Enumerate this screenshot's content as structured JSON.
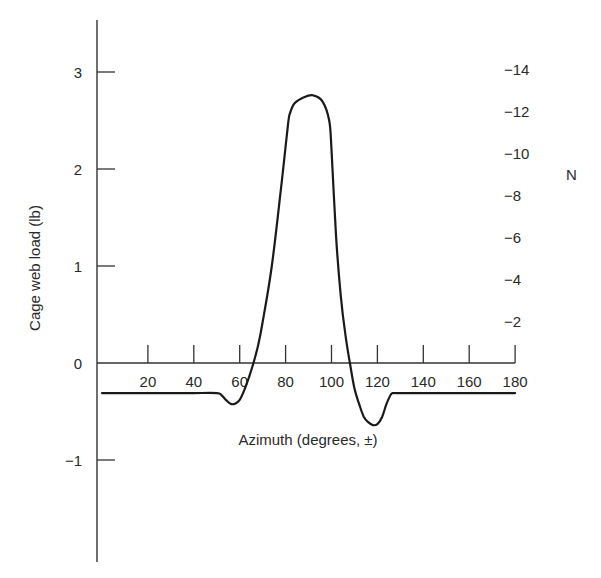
{
  "chart_data": {
    "type": "line",
    "title": "",
    "xlabel": "Azimuth (degrees, ±)",
    "ylabel": "Cage web load (lb)",
    "y2label": "N",
    "xlim": [
      0,
      180
    ],
    "ylim": [
      -2.0,
      3.5
    ],
    "y2lim": [
      0,
      -14
    ],
    "x_ticks": [
      20,
      40,
      60,
      80,
      100,
      120,
      140,
      160,
      180
    ],
    "x_tick_labels": [
      "20",
      "40",
      "60",
      "80",
      "100",
      "120",
      "140",
      "160",
      "180"
    ],
    "y_ticks": [
      3,
      2,
      1,
      0,
      -1
    ],
    "y_tick_labels": [
      "3",
      "2",
      "1",
      "0",
      "−1"
    ],
    "y2_ticks": [
      -14,
      -12,
      -10,
      -8,
      -6,
      -4,
      -2
    ],
    "y2_tick_labels": [
      "−14",
      "−12",
      "−10",
      "−8",
      "−6",
      "−4",
      "−2"
    ],
    "grid": false,
    "legend": null,
    "series": [
      {
        "name": "Cage web load",
        "x": [
          0,
          10,
          20,
          30,
          40,
          50,
          52,
          54,
          56,
          58,
          60,
          62,
          64,
          66,
          68,
          70,
          74,
          78,
          81,
          82,
          84,
          88,
          92,
          96,
          99,
          100,
          102,
          104,
          106,
          108,
          110,
          112,
          114,
          116,
          118,
          120,
          122,
          124,
          126,
          127,
          130,
          140,
          150,
          160,
          170,
          180
        ],
        "values": [
          -0.31,
          -0.31,
          -0.31,
          -0.31,
          -0.31,
          -0.31,
          -0.33,
          -0.38,
          -0.42,
          -0.42,
          -0.38,
          -0.28,
          -0.15,
          0.0,
          0.18,
          0.42,
          1.0,
          1.8,
          2.45,
          2.58,
          2.68,
          2.74,
          2.76,
          2.7,
          2.5,
          2.2,
          1.3,
          0.7,
          0.3,
          0.0,
          -0.26,
          -0.42,
          -0.55,
          -0.61,
          -0.64,
          -0.63,
          -0.56,
          -0.42,
          -0.32,
          -0.31,
          -0.31,
          -0.31,
          -0.31,
          -0.31,
          -0.31,
          -0.31
        ]
      }
    ]
  }
}
